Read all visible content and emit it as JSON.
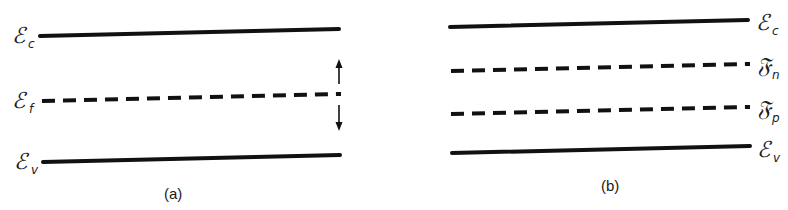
{
  "panels": [
    {
      "id": "a",
      "caption": "(a)",
      "levels": [
        {
          "symbol": "ℰ",
          "sub": "c",
          "style": "solid",
          "name": "conduction-band-edge"
        },
        {
          "symbol": "ℰ",
          "sub": "f",
          "style": "dashed",
          "name": "fermi-level"
        },
        {
          "symbol": "ℰ",
          "sub": "v",
          "style": "solid",
          "name": "valence-band-edge"
        }
      ],
      "label_side": "left",
      "arrows": [
        "up",
        "down"
      ]
    },
    {
      "id": "b",
      "caption": "(b)",
      "levels": [
        {
          "symbol": "ℰ",
          "sub": "c",
          "style": "solid",
          "name": "conduction-band-edge"
        },
        {
          "symbol": "𝔉",
          "sub": "n",
          "style": "dashed",
          "name": "electron-quasi-fermi-level"
        },
        {
          "symbol": "𝔉",
          "sub": "p",
          "style": "dashed",
          "name": "hole-quasi-fermi-level"
        },
        {
          "symbol": "ℰ",
          "sub": "v",
          "style": "solid",
          "name": "valence-band-edge"
        }
      ],
      "label_side": "right"
    }
  ],
  "labels": {
    "a_ec_sym": "ℰ",
    "a_ec_sub": "c",
    "a_ef_sym": "ℰ",
    "a_ef_sub": "f",
    "a_ev_sym": "ℰ",
    "a_ev_sub": "v",
    "b_ec_sym": "ℰ",
    "b_ec_sub": "c",
    "b_fn_sym": "𝔉",
    "b_fn_sub": "n",
    "b_fp_sym": "𝔉",
    "b_fp_sub": "p",
    "b_ev_sym": "ℰ",
    "b_ev_sub": "v",
    "caption_a": "(a)",
    "caption_b": "(b)"
  }
}
